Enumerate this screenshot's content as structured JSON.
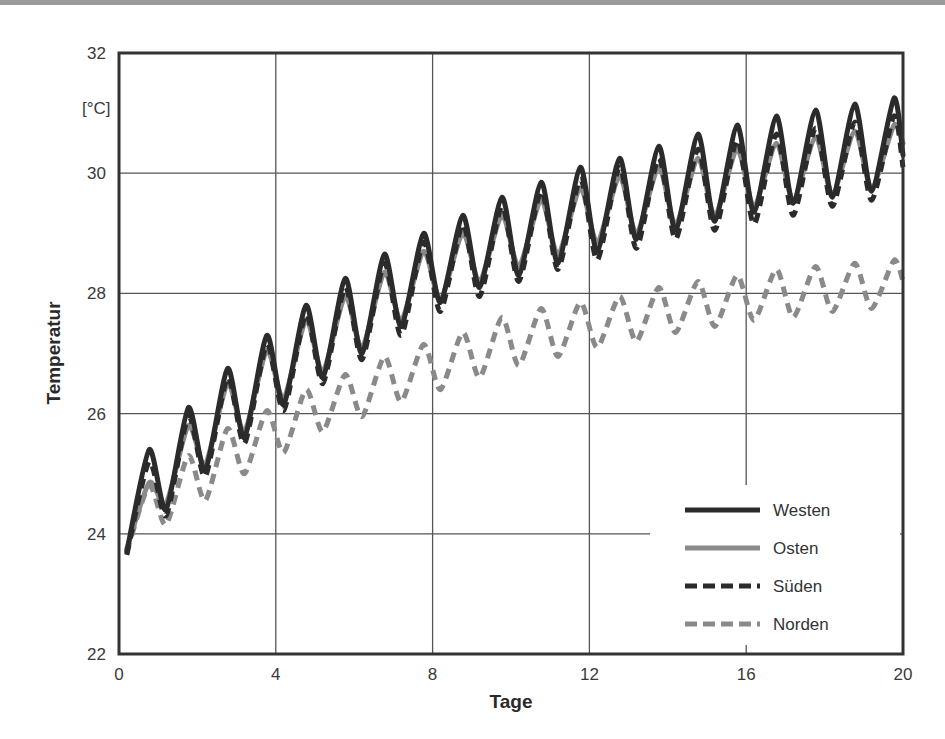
{
  "chart_data": {
    "type": "line",
    "title": "",
    "xlabel": "Tage",
    "ylabel": "Temperatur",
    "yunit": "[°C]",
    "xlim": [
      0,
      20
    ],
    "ylim": [
      22,
      32
    ],
    "xticks": [
      "0",
      "4",
      "8",
      "12",
      "16",
      "20"
    ],
    "yticks": [
      "22",
      "24",
      "26",
      "28",
      "30",
      "32"
    ],
    "grid": true,
    "legend_position": "lower right",
    "cycle_model": "daily oscillation; trough at day k+0.2, peak at day k+0.77",
    "series": [
      {
        "name": "Westen",
        "color": "#2b2b2b",
        "style": "solid",
        "peaks": [
          25.4,
          26.1,
          26.75,
          27.3,
          27.8,
          28.25,
          28.65,
          29.0,
          29.3,
          29.6,
          29.85,
          30.1,
          30.25,
          30.45,
          30.65,
          30.8,
          30.95,
          31.05,
          31.15,
          31.25
        ],
        "troughs": [
          23.7,
          24.4,
          25.05,
          25.6,
          26.15,
          26.6,
          27.0,
          27.45,
          27.85,
          28.1,
          28.3,
          28.5,
          28.7,
          28.9,
          29.05,
          29.2,
          29.35,
          29.5,
          29.6,
          29.7
        ],
        "end_value": 30.3
      },
      {
        "name": "Osten",
        "color": "#8a8a8a",
        "style": "solid",
        "peaks": [
          24.85,
          25.8,
          26.5,
          27.05,
          27.55,
          27.95,
          28.35,
          28.7,
          29.0,
          29.3,
          29.55,
          29.75,
          29.95,
          30.1,
          30.25,
          30.4,
          30.5,
          30.6,
          30.7,
          30.8
        ],
        "troughs": [
          23.75,
          24.5,
          25.15,
          25.7,
          26.25,
          26.7,
          27.1,
          27.55,
          27.9,
          28.2,
          28.45,
          28.65,
          28.85,
          29.0,
          29.15,
          29.3,
          29.45,
          29.55,
          29.65,
          29.75
        ],
        "end_value": 30.5
      },
      {
        "name": "Süden",
        "color": "#2b2b2b",
        "style": "dashed",
        "peaks": [
          25.2,
          25.95,
          26.6,
          27.15,
          27.65,
          28.1,
          28.5,
          28.85,
          29.15,
          29.45,
          29.7,
          29.9,
          30.1,
          30.25,
          30.4,
          30.55,
          30.65,
          30.75,
          30.85,
          30.95
        ],
        "troughs": [
          23.65,
          24.3,
          24.95,
          25.5,
          26.05,
          26.5,
          26.9,
          27.3,
          27.7,
          27.95,
          28.2,
          28.4,
          28.55,
          28.75,
          28.9,
          29.05,
          29.15,
          29.3,
          29.45,
          29.55
        ],
        "end_value": 30.1
      },
      {
        "name": "Norden",
        "color": "#8a8a8a",
        "style": "dashed",
        "peaks": [
          24.8,
          25.3,
          25.75,
          26.05,
          26.4,
          26.65,
          26.95,
          27.15,
          27.35,
          27.6,
          27.75,
          27.85,
          27.95,
          28.1,
          28.2,
          28.3,
          28.4,
          28.45,
          28.5,
          28.55
        ],
        "troughs": [
          23.7,
          24.15,
          24.55,
          25.0,
          25.35,
          25.7,
          25.95,
          26.2,
          26.4,
          26.6,
          26.8,
          26.95,
          27.1,
          27.2,
          27.35,
          27.45,
          27.55,
          27.6,
          27.7,
          27.75
        ],
        "end_value": 28.2
      }
    ]
  }
}
